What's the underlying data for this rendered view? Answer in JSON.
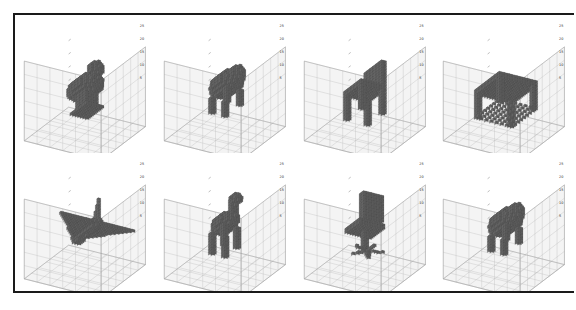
{
  "figure": {
    "title": "",
    "background_color": "#ffffff",
    "frame_color": "#1a1a1a",
    "layout": {
      "rows": 2,
      "cols": 4
    }
  },
  "style": {
    "voxel_color": "#6a6a6a",
    "voxel_edge_color": "#4a4a4a",
    "pane_color": "#f2f2f2",
    "grid_color": "#b8b8b8",
    "axis_color": "#9a9a9a",
    "tick_label_color": "#2a2a2a"
  },
  "chart_data": {
    "type": "scatter",
    "title": "",
    "xlabel": "",
    "ylabel": "",
    "zlabel": "",
    "grid": true,
    "legend": null,
    "axis_range": [
      0,
      30
    ],
    "tick_labels": [
      "25",
      "20",
      "15",
      "10",
      "5"
    ],
    "projection": "3d-voxel",
    "panels": [
      {
        "index": 0,
        "row": 0,
        "col": 0,
        "object": "bird",
        "caption": "",
        "tick_labels": [
          "25",
          "20",
          "15",
          "10",
          "5"
        ],
        "occupied_voxel_fraction": 0.11
      },
      {
        "index": 1,
        "row": 0,
        "col": 1,
        "object": "cow",
        "caption": "",
        "tick_labels": [
          "25",
          "20",
          "15",
          "10",
          "5"
        ],
        "occupied_voxel_fraction": 0.1
      },
      {
        "index": 2,
        "row": 0,
        "col": 2,
        "object": "chair",
        "caption": "",
        "tick_labels": [
          "25",
          "20",
          "15",
          "10",
          "5"
        ],
        "occupied_voxel_fraction": 0.09
      },
      {
        "index": 3,
        "row": 0,
        "col": 3,
        "object": "table",
        "caption": "",
        "tick_labels": [
          "25",
          "20",
          "15",
          "10",
          "5"
        ],
        "occupied_voxel_fraction": 0.12
      },
      {
        "index": 4,
        "row": 1,
        "col": 0,
        "object": "airplane",
        "caption": "",
        "tick_labels": [
          "25",
          "20",
          "15",
          "10",
          "5"
        ],
        "occupied_voxel_fraction": 0.08
      },
      {
        "index": 5,
        "row": 1,
        "col": 1,
        "object": "deer",
        "caption": "",
        "tick_labels": [
          "25",
          "20",
          "15",
          "10",
          "5"
        ],
        "occupied_voxel_fraction": 0.09
      },
      {
        "index": 6,
        "row": 1,
        "col": 2,
        "object": "office-chair",
        "caption": "",
        "tick_labels": [
          "25",
          "20",
          "15",
          "10",
          "5"
        ],
        "occupied_voxel_fraction": 0.09
      },
      {
        "index": 7,
        "row": 1,
        "col": 3,
        "object": "cow",
        "caption": "",
        "tick_labels": [
          "25",
          "20",
          "15",
          "10",
          "5"
        ],
        "occupied_voxel_fraction": 0.11
      }
    ]
  }
}
